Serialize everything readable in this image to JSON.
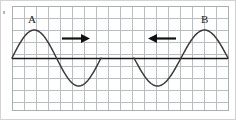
{
  "figure": {
    "background_color": "#ffffff",
    "border_color": "#cfcfcf",
    "corner_mark": "dot-artifact"
  },
  "grid": {
    "line_color": "#b9bdc5",
    "major_line_color": "#a9aeb7",
    "cell_size_px": 12,
    "x_start": 12,
    "x_end": 228,
    "y_start": 6,
    "y_end": 110,
    "columns": 18,
    "rows": 9
  },
  "axis": {
    "name": "equilibrium-line",
    "color": "#1a1a1a",
    "y": 58,
    "x_start": 12,
    "x_end": 228,
    "stroke_width": 1.4
  },
  "waves": {
    "color": "#3a3a3a",
    "stroke_width": 1.5,
    "left": {
      "label": "A",
      "label_x": 28,
      "label_y": 14,
      "crest_x": 33,
      "crest_y": 30,
      "trough_x": 67,
      "trough_y": 86,
      "start_x": 12,
      "end_x": 101,
      "amplitude": 28,
      "direction": "right"
    },
    "right": {
      "label": "B",
      "label_x": 201,
      "label_y": 14,
      "crest_x": 205,
      "crest_y": 30,
      "trough_x": 168,
      "trough_y": 86,
      "start_x": 134,
      "end_x": 228,
      "amplitude": 28,
      "direction": "left"
    }
  },
  "arrows": [
    {
      "name": "arrow-right",
      "direction": "right",
      "x_start": 62,
      "x_end": 90,
      "y": 38,
      "color": "#111111"
    },
    {
      "name": "arrow-left",
      "direction": "left",
      "x_start": 148,
      "x_end": 176,
      "y": 38,
      "color": "#111111"
    }
  ],
  "labels": {
    "a": "A",
    "b": "B"
  }
}
